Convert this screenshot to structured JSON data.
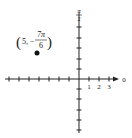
{
  "diagram": {
    "type": "polar-coordinate-plot",
    "pole_label": "0",
    "top_label_num": "π",
    "top_label_den": "2",
    "tick_labels": [
      "1",
      "2",
      "3"
    ],
    "point": {
      "r": "5",
      "theta_num": "7π",
      "theta_den": "6",
      "theta_sign": "−",
      "label_open": "(",
      "label_close": ")",
      "label_sep": ","
    },
    "colors": {
      "axis": "#222222",
      "point": "#111111"
    }
  }
}
